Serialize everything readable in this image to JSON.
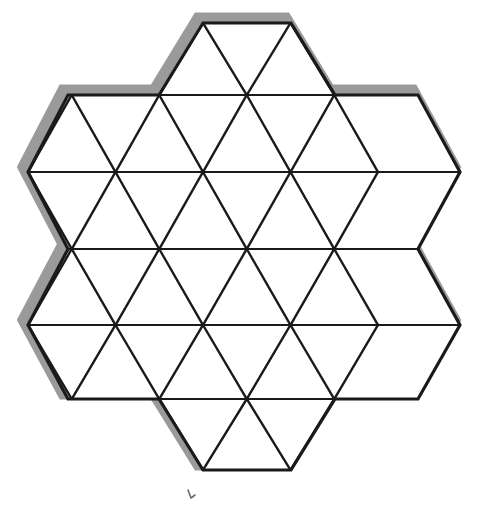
{
  "figure": {
    "canvas": {
      "width": 488,
      "height": 507,
      "background": "#ffffff"
    },
    "style": {
      "outline_color": "#1a1a1a",
      "outline_width": 3.2,
      "grid_color": "#1a1a1a",
      "grid_width": 2.4,
      "thin_grid_width": 1.8,
      "shadow_color": "#9a9a9a",
      "shadow_width": 11,
      "shadow_offset_x": -5,
      "shadow_offset_y": -5,
      "fill_color": "#ffffff"
    },
    "geometry": {
      "description": "Equilateral triangular lattice clipped to a 6-pointed hexagonal star boundary",
      "column_spacing": 87.5,
      "row_spacing": 75.5,
      "rows_y": [
        23,
        95,
        172,
        249,
        325,
        399,
        470
      ],
      "row_x_extents": [
        [
          203,
          291
        ],
        [
          68,
          418
        ],
        [
          28,
          460
        ],
        [
          68,
          418
        ],
        [
          28,
          460
        ],
        [
          68,
          418
        ],
        [
          203,
          291
        ]
      ],
      "lattice_origin_x": 28,
      "triangle_count": 48,
      "boundary_points": "203,23 291,23 335,95 418,95 460,172 418,249 460,325 418,399 335,399 291,470 203,470 159,399 68,399 28,325 68,249 28,172 68,95 159,95"
    },
    "annotation": {
      "mark_label": "b",
      "mark_x": 188,
      "mark_y": 498,
      "mark_visible": true
    }
  }
}
